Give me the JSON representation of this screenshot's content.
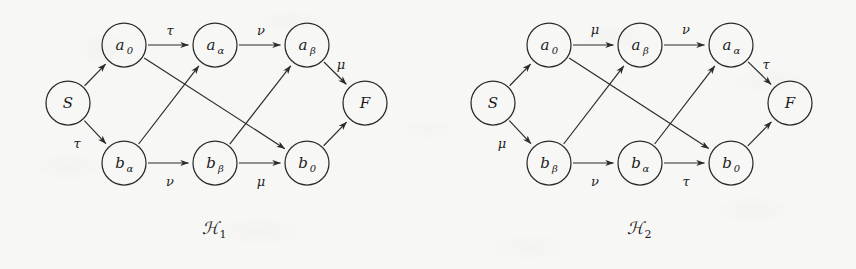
{
  "figure": {
    "background_color": "#f7f7f6",
    "ink_color": "#2b2b2b",
    "width": 856,
    "height": 269
  },
  "graphs": [
    {
      "id": "H1",
      "caption_base": "ℋ",
      "caption_sub": "1",
      "caption_x": 215,
      "caption_y": 228,
      "nodes": [
        {
          "id": "S",
          "base": "S",
          "sub": "",
          "x": 68,
          "y": 103,
          "r": 22
        },
        {
          "id": "a0",
          "base": "a",
          "sub": "0",
          "x": 124,
          "y": 45,
          "r": 22
        },
        {
          "id": "aalpha",
          "base": "a",
          "sub": "α",
          "x": 215,
          "y": 45,
          "r": 22
        },
        {
          "id": "abeta",
          "base": "a",
          "sub": "β",
          "x": 307,
          "y": 45,
          "r": 22
        },
        {
          "id": "balpha",
          "base": "b",
          "sub": "α",
          "x": 124,
          "y": 163,
          "r": 22
        },
        {
          "id": "bbeta",
          "base": "b",
          "sub": "β",
          "x": 215,
          "y": 163,
          "r": 22
        },
        {
          "id": "b0",
          "base": "b",
          "sub": "0",
          "x": 307,
          "y": 163,
          "r": 22
        },
        {
          "id": "F",
          "base": "F",
          "sub": "",
          "x": 365,
          "y": 103,
          "r": 22
        }
      ],
      "edges": [
        {
          "from": "S",
          "to": "a0",
          "label": "",
          "label_x": 0,
          "label_y": 0
        },
        {
          "from": "S",
          "to": "balpha",
          "label": "τ",
          "label_x": 77,
          "label_y": 143
        },
        {
          "from": "a0",
          "to": "aalpha",
          "label": "τ",
          "label_x": 170,
          "label_y": 30
        },
        {
          "from": "aalpha",
          "to": "abeta",
          "label": "ν",
          "label_x": 261,
          "label_y": 30
        },
        {
          "from": "balpha",
          "to": "bbeta",
          "label": "ν",
          "label_x": 170,
          "label_y": 181
        },
        {
          "from": "bbeta",
          "to": "b0",
          "label": "μ",
          "label_x": 261,
          "label_y": 181
        },
        {
          "from": "a0",
          "to": "b0",
          "label": "",
          "label_x": 0,
          "label_y": 0
        },
        {
          "from": "balpha",
          "to": "aalpha",
          "label": "",
          "label_x": 0,
          "label_y": 0
        },
        {
          "from": "bbeta",
          "to": "abeta",
          "label": "",
          "label_x": 0,
          "label_y": 0
        },
        {
          "from": "abeta",
          "to": "F",
          "label": "μ",
          "label_x": 341,
          "label_y": 64
        },
        {
          "from": "b0",
          "to": "F",
          "label": "",
          "label_x": 0,
          "label_y": 0
        }
      ]
    },
    {
      "id": "H2",
      "caption_base": "ℋ",
      "caption_sub": "2",
      "caption_x": 640,
      "caption_y": 228,
      "nodes": [
        {
          "id": "S",
          "base": "S",
          "sub": "",
          "x": 493,
          "y": 103,
          "r": 22
        },
        {
          "id": "a0",
          "base": "a",
          "sub": "0",
          "x": 549,
          "y": 45,
          "r": 22
        },
        {
          "id": "abeta",
          "base": "a",
          "sub": "β",
          "x": 640,
          "y": 45,
          "r": 22
        },
        {
          "id": "aalpha",
          "base": "a",
          "sub": "α",
          "x": 731,
          "y": 45,
          "r": 22
        },
        {
          "id": "bbeta",
          "base": "b",
          "sub": "β",
          "x": 549,
          "y": 163,
          "r": 22
        },
        {
          "id": "balpha",
          "base": "b",
          "sub": "α",
          "x": 640,
          "y": 163,
          "r": 22
        },
        {
          "id": "b0",
          "base": "b",
          "sub": "0",
          "x": 731,
          "y": 163,
          "r": 22
        },
        {
          "id": "F",
          "base": "F",
          "sub": "",
          "x": 790,
          "y": 103,
          "r": 22
        }
      ],
      "edges": [
        {
          "from": "S",
          "to": "a0",
          "label": "",
          "label_x": 0,
          "label_y": 0
        },
        {
          "from": "S",
          "to": "bbeta",
          "label": "μ",
          "label_x": 502,
          "label_y": 143
        },
        {
          "from": "a0",
          "to": "abeta",
          "label": "μ",
          "label_x": 595,
          "label_y": 29
        },
        {
          "from": "abeta",
          "to": "aalpha",
          "label": "ν",
          "label_x": 686,
          "label_y": 29
        },
        {
          "from": "bbeta",
          "to": "balpha",
          "label": "ν",
          "label_x": 595,
          "label_y": 181
        },
        {
          "from": "balpha",
          "to": "b0",
          "label": "τ",
          "label_x": 686,
          "label_y": 181
        },
        {
          "from": "a0",
          "to": "b0",
          "label": "",
          "label_x": 0,
          "label_y": 0
        },
        {
          "from": "bbeta",
          "to": "abeta",
          "label": "",
          "label_x": 0,
          "label_y": 0
        },
        {
          "from": "balpha",
          "to": "aalpha",
          "label": "",
          "label_x": 0,
          "label_y": 0
        },
        {
          "from": "aalpha",
          "to": "F",
          "label": "τ",
          "label_x": 766,
          "label_y": 64
        },
        {
          "from": "b0",
          "to": "F",
          "label": "",
          "label_x": 0,
          "label_y": 0
        }
      ]
    }
  ]
}
